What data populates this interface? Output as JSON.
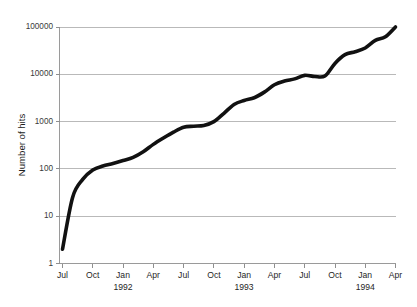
{
  "chart_data": {
    "type": "line",
    "title": "",
    "xlabel": "",
    "ylabel": "Number of hits",
    "yscale": "log",
    "ylim": [
      1,
      100000
    ],
    "grid": true,
    "legend_position": "none",
    "series_color": "#111111",
    "gridline_color": "#b9b9b9",
    "axis_color": "#9a9a9a",
    "y_ticks": [
      {
        "value": 100000,
        "label": "100000"
      },
      {
        "value": 10000,
        "label": "10000"
      },
      {
        "value": 1000,
        "label": "1000"
      },
      {
        "value": 100,
        "label": "100"
      },
      {
        "value": 10,
        "label": "10"
      },
      {
        "value": 1,
        "label": "1"
      }
    ],
    "x_ticks": [
      {
        "label": "Jul",
        "year": ""
      },
      {
        "label": "Oct",
        "year": ""
      },
      {
        "label": "Jan",
        "year": "1992"
      },
      {
        "label": "Apr",
        "year": ""
      },
      {
        "label": "Jul",
        "year": ""
      },
      {
        "label": "Oct",
        "year": ""
      },
      {
        "label": "Jan",
        "year": "1993"
      },
      {
        "label": "Apr",
        "year": ""
      },
      {
        "label": "Jul",
        "year": ""
      },
      {
        "label": "Oct",
        "year": ""
      },
      {
        "label": "Jan",
        "year": "1994"
      },
      {
        "label": "Apr",
        "year": ""
      }
    ],
    "series": [
      {
        "name": "Number of hits",
        "x": [
          "Jul 1991",
          "Aug 1991",
          "Sep 1991",
          "Oct 1991",
          "Nov 1991",
          "Dec 1991",
          "Jan 1992",
          "Feb 1992",
          "Mar 1992",
          "Apr 1992",
          "May 1992",
          "Jun 1992",
          "Jul 1992",
          "Aug 1992",
          "Sep 1992",
          "Oct 1992",
          "Nov 1992",
          "Dec 1992",
          "Jan 1993",
          "Feb 1993",
          "Mar 1993",
          "Apr 1993",
          "May 1993",
          "Jun 1993",
          "Jul 1993",
          "Aug 1993",
          "Sep 1993",
          "Oct 1993",
          "Nov 1993",
          "Dec 1993",
          "Jan 1994",
          "Feb 1994",
          "Mar 1994",
          "Apr 1994"
        ],
        "values": [
          2,
          25,
          60,
          95,
          115,
          130,
          150,
          175,
          230,
          330,
          450,
          600,
          760,
          800,
          830,
          1000,
          1500,
          2300,
          2800,
          3200,
          4200,
          6000,
          7200,
          8000,
          9500,
          9000,
          9200,
          17000,
          26000,
          30000,
          36000,
          52000,
          62000,
          100000
        ]
      }
    ]
  },
  "labels": {
    "y_axis_title": "Number of hits"
  }
}
